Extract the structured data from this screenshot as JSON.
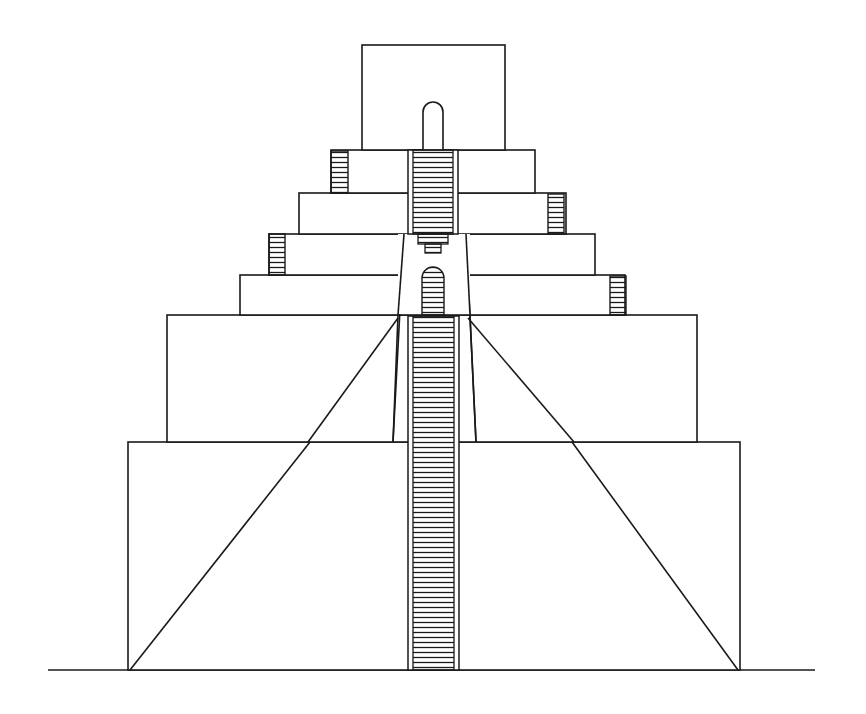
{
  "figure": {
    "title": "",
    "stroke_color": "#1a1a1a",
    "background": "#ffffff"
  },
  "ground": {
    "x1": 48,
    "x2": 815,
    "y": 670
  },
  "base": {
    "x": 128,
    "y": 442,
    "w": 612,
    "h": 228
  },
  "tier2": {
    "x": 167,
    "y": 315,
    "w": 530,
    "h": 127
  },
  "tiers_upper": [
    {
      "x": 240,
      "y": 275,
      "w": 385,
      "h": 40,
      "side_stair": "right"
    },
    {
      "x": 269,
      "y": 234,
      "w": 326,
      "h": 41,
      "side_stair": "left"
    },
    {
      "x": 299,
      "y": 193,
      "w": 267,
      "h": 41,
      "side_stair": "right"
    },
    {
      "x": 331,
      "y": 150,
      "w": 204,
      "h": 43,
      "side_stair": "left"
    }
  ],
  "shrine": {
    "x": 362,
    "y": 45,
    "w": 143,
    "h": 105
  },
  "central_stair": {
    "x": 409,
    "w": 50,
    "y_top": 315,
    "y_bottom": 670
  },
  "upper_stair": {
    "x": 413,
    "w": 44,
    "y_top": 150,
    "y_bottom": 234
  }
}
